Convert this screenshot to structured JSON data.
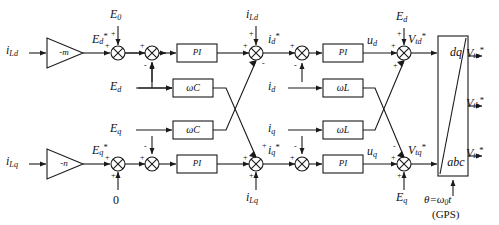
{
  "figure": {
    "type": "control-block-diagram",
    "background": "#ffffff",
    "line_color": "#1a1a1a",
    "text_color": "#111111"
  },
  "inputs": [
    {
      "id": "iLd_in",
      "label": "i",
      "sub": "Ld",
      "sup": "",
      "x": 14,
      "y": 38
    },
    {
      "id": "iLq_in",
      "label": "i",
      "sub": "Lq",
      "sup": "",
      "x": 14,
      "y": 155
    },
    {
      "id": "E0_in",
      "label": "E",
      "sub": "0",
      "sup": "",
      "x": 78,
      "y": 10
    },
    {
      "id": "zero_in",
      "label": "0",
      "sub": "",
      "sup": "",
      "x": 70,
      "y": 196
    },
    {
      "id": "Ed_in",
      "label": "E",
      "sub": "d",
      "sup": "",
      "x": 115,
      "y": 80
    },
    {
      "id": "Eq_in",
      "label": "E",
      "sub": "q",
      "sup": "",
      "x": 115,
      "y": 123
    },
    {
      "id": "iLd_inj",
      "label": "i",
      "sub": "Ld",
      "sup": "",
      "x": 245,
      "y": 10
    },
    {
      "id": "iLq_inj",
      "label": "i",
      "sub": "Lq",
      "sup": "",
      "x": 245,
      "y": 190
    },
    {
      "id": "id_fb",
      "label": "i",
      "sub": "d",
      "sup": "",
      "x": 283,
      "y": 80
    },
    {
      "id": "iq_fb",
      "label": "i",
      "sub": "q",
      "sup": "",
      "x": 283,
      "y": 123
    },
    {
      "id": "Ed_ff",
      "label": "E",
      "sub": "d",
      "sup": "",
      "x": 377,
      "y": 12
    },
    {
      "id": "Eq_ff",
      "label": "E",
      "sub": "q",
      "sup": "",
      "x": 377,
      "y": 188
    }
  ],
  "gain_blocks": [
    {
      "id": "gain_m",
      "label": "-m",
      "x": 40,
      "y": 38,
      "w": 36,
      "h": 30
    },
    {
      "id": "gain_n",
      "label": "-n",
      "x": 40,
      "y": 155,
      "w": 36,
      "h": 30
    }
  ],
  "process_blocks": [
    {
      "id": "pi_d_outer",
      "label": "PI",
      "x": 172,
      "y": 38,
      "w": 38,
      "h": 17
    },
    {
      "id": "wc_d",
      "label": "ωC",
      "x": 172,
      "y": 78,
      "w": 38,
      "h": 17
    },
    {
      "id": "wc_q",
      "label": "ωC",
      "x": 172,
      "y": 120,
      "w": 38,
      "h": 17
    },
    {
      "id": "pi_q_outer",
      "label": "PI",
      "x": 172,
      "y": 158,
      "w": 38,
      "h": 17
    },
    {
      "id": "pi_d_inner",
      "label": "PI",
      "x": 312,
      "y": 38,
      "w": 38,
      "h": 17
    },
    {
      "id": "wl_d",
      "label": "ωL",
      "x": 312,
      "y": 78,
      "w": 38,
      "h": 17
    },
    {
      "id": "wl_q",
      "label": "ωL",
      "x": 312,
      "y": 120,
      "w": 38,
      "h": 17
    },
    {
      "id": "pi_q_inner",
      "label": "PI",
      "x": 312,
      "y": 158,
      "w": 38,
      "h": 17
    }
  ],
  "transform_block": {
    "id": "dq_abc",
    "top_label": "dq",
    "bottom_label": "abc",
    "x": 440,
    "y": 36,
    "w": 42,
    "h": 140,
    "angle_input": {
      "label": "θ=ω",
      "sub": "0",
      "tail": "t",
      "x": 424,
      "y": 196
    },
    "angle_source": "(GPS)"
  },
  "signals": [
    {
      "id": "Ed_ref",
      "label": "E",
      "sub": "d",
      "sup": "*",
      "x": 96,
      "y": 32
    },
    {
      "id": "Eq_ref",
      "label": "E",
      "sub": "q",
      "sup": "*",
      "x": 96,
      "y": 148
    },
    {
      "id": "id_ref",
      "label": "i",
      "sub": "d",
      "sup": "*",
      "x": 256,
      "y": 32
    },
    {
      "id": "iq_ref",
      "label": "i",
      "sub": "q",
      "sup": "*",
      "x": 256,
      "y": 148
    },
    {
      "id": "ud",
      "label": "u",
      "sub": "d",
      "sup": "",
      "x": 355,
      "y": 32
    },
    {
      "id": "uq",
      "label": "u",
      "sub": "q",
      "sup": "",
      "x": 355,
      "y": 148
    },
    {
      "id": "Vtd_ref",
      "label": "V",
      "sub": "td",
      "sup": "*",
      "x": 402,
      "y": 32
    },
    {
      "id": "Vtq_ref",
      "label": "V",
      "sub": "tq",
      "sup": "*",
      "x": 402,
      "y": 148
    }
  ],
  "outputs": [
    {
      "id": "Vta",
      "label": "V",
      "sub": "ta",
      "sup": "*",
      "x": 474,
      "y": 52
    },
    {
      "id": "Vtb",
      "label": "V",
      "sub": "tb",
      "sup": "*",
      "x": 474,
      "y": 104
    },
    {
      "id": "Vtc",
      "label": "V",
      "sub": "tc",
      "sup": "*",
      "x": 474,
      "y": 156
    }
  ],
  "summers": [
    {
      "id": "sum_ed",
      "x": 118,
      "y": 47,
      "r": 7,
      "signs": [
        {
          "s": "+",
          "x": 110,
          "y": 36
        },
        {
          "s": "+",
          "x": 124,
          "y": 33
        }
      ]
    },
    {
      "id": "sum_eq",
      "x": 118,
      "y": 164,
      "r": 7,
      "signs": [
        {
          "s": "+",
          "x": 110,
          "y": 153
        },
        {
          "s": "+",
          "x": 124,
          "y": 176
        }
      ]
    },
    {
      "id": "sum_id_ref",
      "x": 228,
      "y": 47,
      "r": 7,
      "signs": [
        {
          "s": "+",
          "x": 220,
          "y": 36
        },
        {
          "s": "-",
          "x": 222,
          "y": 56
        }
      ]
    },
    {
      "id": "sum_iq_ref",
      "x": 228,
      "y": 164,
      "r": 7,
      "signs": [
        {
          "s": "+",
          "x": 220,
          "y": 170
        },
        {
          "s": "-",
          "x": 222,
          "y": 146
        }
      ]
    },
    {
      "id": "sum_iLd",
      "x": 262,
      "y": 47,
      "r": 7,
      "signs": [
        {
          "s": "+",
          "x": 252,
          "y": 36
        },
        {
          "s": "-",
          "x": 272,
          "y": 52
        }
      ]
    },
    {
      "id": "sum_iLq",
      "x": 262,
      "y": 164,
      "r": 7,
      "signs": [
        {
          "s": "+",
          "x": 252,
          "y": 170
        },
        {
          "s": "+",
          "x": 272,
          "y": 152
        }
      ]
    },
    {
      "id": "sum_ud",
      "x": 368,
      "y": 47,
      "r": 7,
      "signs": [
        {
          "s": "+",
          "x": 360,
          "y": 36
        },
        {
          "s": "+",
          "x": 360,
          "y": 56
        }
      ]
    },
    {
      "id": "sum_uq",
      "x": 368,
      "y": 164,
      "r": 7,
      "signs": [
        {
          "s": "-",
          "x": 362,
          "y": 150
        },
        {
          "s": "+",
          "x": 360,
          "y": 170
        }
      ]
    },
    {
      "id": "sum_vtd",
      "x": 404,
      "y": 47,
      "r": 7,
      "signs": [
        {
          "s": "+",
          "x": 396,
          "y": 36
        },
        {
          "s": "+",
          "x": 396,
          "y": 58
        }
      ]
    },
    {
      "id": "sum_vtq",
      "x": 404,
      "y": 164,
      "r": 7,
      "signs": [
        {
          "s": "-",
          "x": 398,
          "y": 150
        },
        {
          "s": "+",
          "x": 396,
          "y": 170
        }
      ]
    }
  ]
}
